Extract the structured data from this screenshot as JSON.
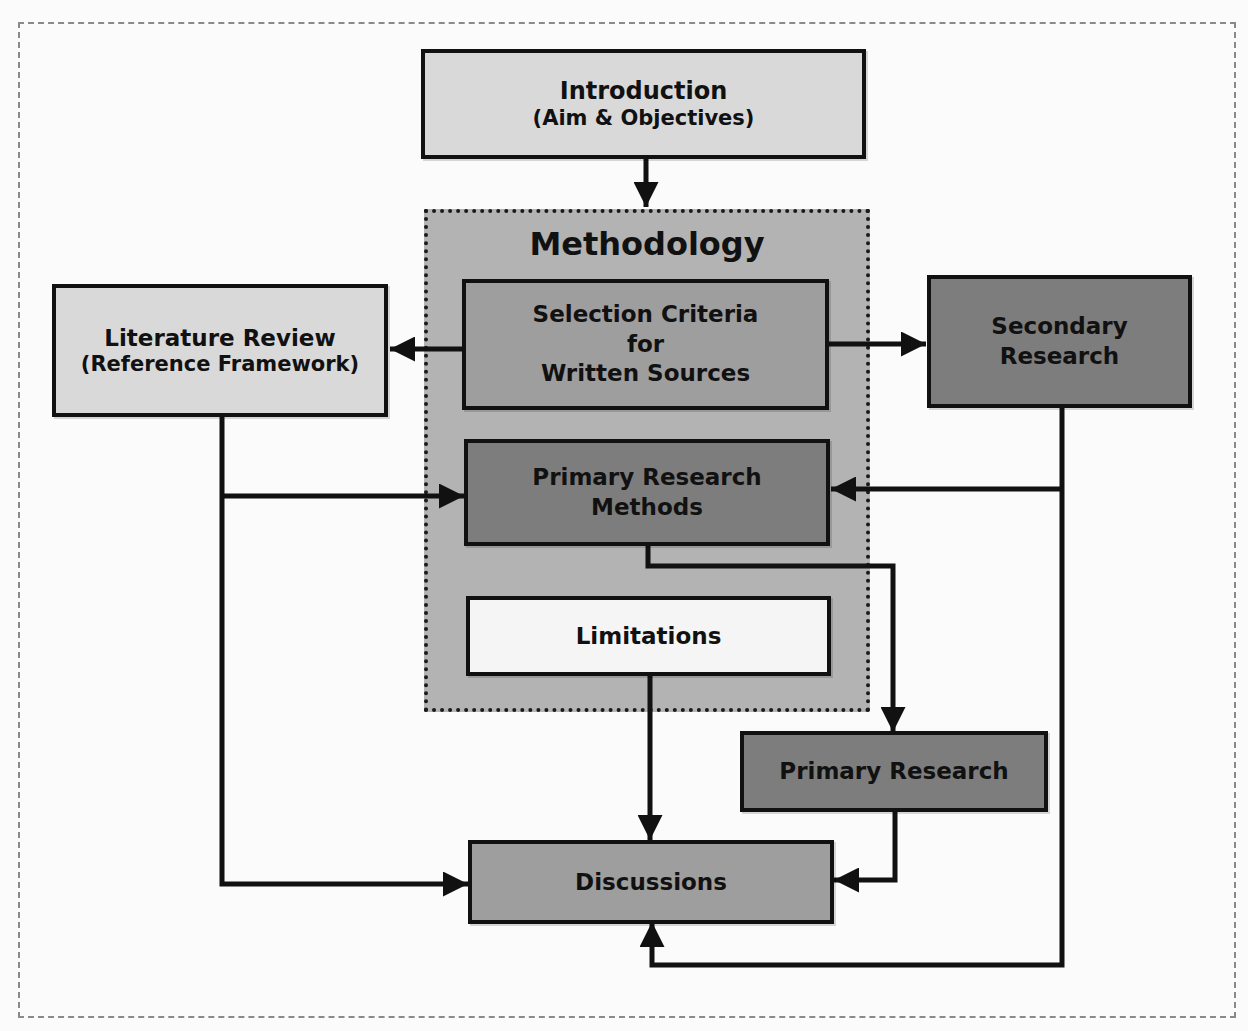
{
  "diagram": {
    "type": "flowchart",
    "colors": {
      "background": "#fbfbfb",
      "frame_border": "#8a8a8a",
      "light_box": "#d9d9d9",
      "methodology_group": "#b3b3b3",
      "mid_box": "#9e9e9e",
      "dark_box": "#7d7d7d",
      "white_box": "#f5f5f5",
      "line": "#111111"
    },
    "nodes": {
      "introduction": {
        "line1": "Introduction",
        "line2": "(Aim & Objectives)"
      },
      "methodology": {
        "title": "Methodology"
      },
      "selection_criteria": {
        "line1": "Selection Criteria",
        "line2": "for",
        "line3": "Written Sources"
      },
      "literature_review": {
        "line1": "Literature Review",
        "line2": "(Reference Framework)"
      },
      "secondary_research": {
        "line1": "Secondary",
        "line2": "Research"
      },
      "primary_research_methods": {
        "line1": "Primary Research",
        "line2": "Methods"
      },
      "limitations": {
        "label": "Limitations"
      },
      "primary_research": {
        "label": "Primary Research"
      },
      "discussions": {
        "label": "Discussions"
      }
    },
    "edges": [
      {
        "from": "Introduction",
        "to": "Methodology"
      },
      {
        "from": "Selection Criteria for Written Sources",
        "to": "Literature Review"
      },
      {
        "from": "Selection Criteria for Written Sources",
        "to": "Secondary Research"
      },
      {
        "from": "Literature Review",
        "to": "Primary Research Methods"
      },
      {
        "from": "Literature Review",
        "to": "Discussions"
      },
      {
        "from": "Secondary Research",
        "to": "Primary Research Methods"
      },
      {
        "from": "Secondary Research",
        "to": "Discussions"
      },
      {
        "from": "Primary Research Methods",
        "to": "Primary Research"
      },
      {
        "from": "Limitations",
        "to": "Discussions"
      },
      {
        "from": "Primary Research",
        "to": "Discussions"
      }
    ]
  }
}
